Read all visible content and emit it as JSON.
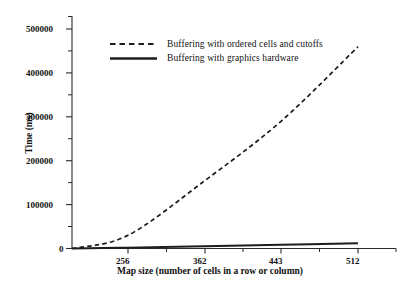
{
  "chart_data": {
    "type": "line",
    "title": "",
    "xlabel": "Map size (number of cells in a row or column)",
    "ylabel": "Time (ms)",
    "x": [
      256,
      362,
      443,
      512
    ],
    "categories": [
      "256",
      "362",
      "443",
      "512"
    ],
    "xtick_labels": [
      "256",
      "362",
      "443",
      "512"
    ],
    "ytick_labels": [
      "0",
      "100000",
      "200000",
      "300000",
      "400000",
      "500000"
    ],
    "ytick_values": [
      0,
      100000,
      200000,
      300000,
      400000,
      500000
    ],
    "yminor_values": [
      50000,
      150000,
      250000,
      350000,
      450000
    ],
    "ylim": [
      0,
      530000
    ],
    "grid": false,
    "legend_position": "upper-center",
    "series": [
      {
        "name": "Buffering with ordered cells and cutoffs",
        "style": "dashed",
        "color": "#1d1d1d",
        "values": [
          30000,
          155000,
          290000,
          460000
        ]
      },
      {
        "name": "Buffering with graphics hardware",
        "style": "solid",
        "color": "#1d1d1d",
        "values": [
          2000,
          5000,
          8500,
          12000
        ]
      }
    ]
  },
  "axes": {
    "y_title": "Time (ms)",
    "x_title": "Map size (number of cells in a row or column)",
    "ytick_0": "0",
    "ytick_1": "100000",
    "ytick_2": "200000",
    "ytick_3": "300000",
    "ytick_4": "400000",
    "ytick_5": "500000",
    "xtick_0": "256",
    "xtick_1": "362",
    "xtick_2": "443",
    "xtick_3": "512"
  },
  "legend": {
    "items": [
      {
        "label": "Buffering with ordered cells and cutoffs",
        "style": "dashed"
      },
      {
        "label": "Buffering with graphics hardware",
        "style": "solid"
      }
    ]
  }
}
